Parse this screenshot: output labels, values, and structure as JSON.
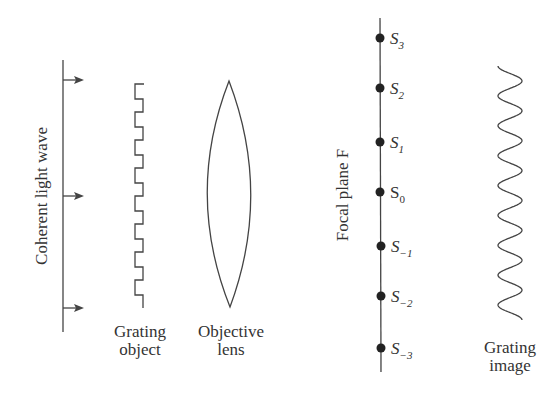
{
  "colors": {
    "stroke": "#444444",
    "text": "#333333",
    "background": "#ffffff"
  },
  "light_wave": {
    "label": "Coherent light wave",
    "arrow_count": 3
  },
  "grating_object": {
    "label_line1": "Grating",
    "label_line2": "object"
  },
  "objective_lens": {
    "label_line1": "Objective",
    "label_line2": "lens"
  },
  "focal_plane": {
    "label": "Focal plane  F",
    "points": [
      {
        "base": "S",
        "sub": "3",
        "italic": true
      },
      {
        "base": "S",
        "sub": "2",
        "italic": true
      },
      {
        "base": "S",
        "sub": "1",
        "italic": true
      },
      {
        "base": "S",
        "sub": "0",
        "italic": false
      },
      {
        "base": "S",
        "sub": "−1",
        "italic": true
      },
      {
        "base": "S",
        "sub": "−2",
        "italic": true
      },
      {
        "base": "S",
        "sub": "−3",
        "italic": true
      }
    ]
  },
  "grating_image": {
    "label_line1": "Grating",
    "label_line2": "image"
  }
}
